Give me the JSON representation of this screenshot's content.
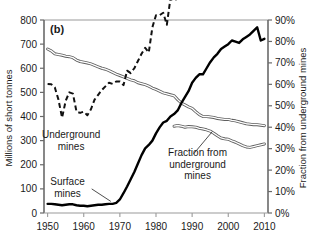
{
  "chart_data": {
    "type": "line",
    "title": "",
    "panel_label": "(b)",
    "xlabel": "",
    "ylabel": "Millions of short tonnes",
    "y2label": "Fraction from underground mines",
    "xlim": [
      1949,
      2011
    ],
    "ylim": [
      0,
      800
    ],
    "y2lim": [
      0,
      90
    ],
    "xticks": [
      1950,
      1960,
      1970,
      1980,
      1990,
      2000,
      2010
    ],
    "xticklabels": [
      "1950",
      "1960",
      "1970",
      "1980",
      "1990",
      "2000",
      "2010"
    ],
    "yticks": [
      0,
      100,
      200,
      300,
      400,
      500,
      600,
      700,
      800
    ],
    "yticklabels": [
      "0",
      "100",
      "200",
      "300",
      "400",
      "500",
      "600",
      "700",
      "800"
    ],
    "y2ticks": [
      0,
      10,
      20,
      30,
      40,
      50,
      60,
      70,
      80,
      90
    ],
    "y2ticklabels": [
      "0%",
      "10%",
      "20%",
      "30%",
      "40%",
      "50%",
      "60%",
      "70%",
      "80%",
      "90%"
    ],
    "grid": false,
    "legend_position": "inline-annotations",
    "annotations": [
      {
        "name": "underground-mines-label",
        "text_lines": [
          "Underground",
          "mines"
        ],
        "x": 1956.5,
        "y": 310,
        "leader": false
      },
      {
        "name": "surface-mines-label",
        "text_lines": [
          "Surface",
          "mines"
        ],
        "x": 1955.5,
        "y": 115,
        "leader": true
      },
      {
        "name": "fraction-underground-label",
        "text_lines": [
          "Fraction from",
          "underground",
          "mines"
        ],
        "x": 1991.5,
        "y": 235,
        "leader": true
      }
    ],
    "series": [
      {
        "name": "Underground mines",
        "axis": "left",
        "style": "double-stroke-gray",
        "color": "#6e6e6e",
        "x": [
          1950,
          1951,
          1952,
          1953,
          1954,
          1955,
          1956,
          1957,
          1958,
          1959,
          1960,
          1961,
          1962,
          1963,
          1964,
          1965,
          1966,
          1967,
          1968,
          1969,
          1970,
          1971,
          1972,
          1973,
          1974,
          1975,
          1976,
          1977,
          1978,
          1979,
          1980,
          1981,
          1982,
          1983,
          1984,
          1985,
          1986,
          1987,
          1988,
          1989,
          1990,
          1991,
          1992,
          1993,
          1994,
          1995,
          1996,
          1997,
          1998,
          1999,
          2000,
          2001,
          2002,
          2003,
          2004,
          2005,
          2006,
          2007,
          2008,
          2009,
          2010
        ],
        "values": [
          680,
          672,
          660,
          657,
          654,
          650,
          648,
          644,
          634,
          628,
          625,
          622,
          618,
          612,
          606,
          600,
          596,
          590,
          583,
          576,
          570,
          564,
          558,
          552,
          548,
          540,
          536,
          532,
          526,
          518,
          512,
          505,
          498,
          494,
          490,
          486,
          470,
          456,
          448,
          440,
          434,
          420,
          408,
          400,
          400,
          398,
          396,
          392,
          390,
          388,
          388,
          384,
          382,
          378,
          374,
          370,
          368,
          366,
          366,
          364,
          362
        ]
      },
      {
        "name": "Total production",
        "axis": "left",
        "style": "dashed-black",
        "color": "#111111",
        "x": [
          1950,
          1951,
          1952,
          1953,
          1954,
          1955,
          1956,
          1957,
          1958,
          1959,
          1960,
          1961,
          1962,
          1963,
          1964,
          1965,
          1966,
          1967,
          1968,
          1969,
          1970,
          1971,
          1972,
          1973,
          1974,
          1975,
          1976,
          1977,
          1978,
          1979,
          1980,
          1981,
          1982,
          1983,
          1984,
          1985,
          1986,
          1987,
          1988,
          1989,
          1990,
          1991,
          1992,
          1993,
          1994,
          1995,
          1996,
          1997,
          1998,
          1999,
          2000,
          2001,
          2002,
          2003,
          2004,
          2005,
          2006,
          2007,
          2008,
          2009,
          2010
        ],
        "values": [
          535,
          534,
          520,
          470,
          395,
          465,
          500,
          495,
          420,
          415,
          420,
          405,
          430,
          470,
          490,
          510,
          525,
          540,
          535,
          545,
          545,
          530,
          590,
          580,
          600,
          630,
          660,
          685,
          665,
          770,
          820,
          820,
          830,
          780,
          890,
          880,
          890,
          915,
          950,
          980,
          1030,
          995,
          1000,
          945,
          1030,
          1030,
          1060,
          1090,
          1115,
          1100,
          1075,
          1125,
          1095,
          1070,
          1110,
          1130,
          1160,
          1145,
          1170,
          1075,
          1085
        ]
      },
      {
        "name": "Surface mines",
        "axis": "left",
        "style": "solid-thick-black",
        "color": "#000000",
        "x": [
          1950,
          1951,
          1952,
          1953,
          1954,
          1955,
          1956,
          1957,
          1958,
          1959,
          1960,
          1961,
          1962,
          1963,
          1964,
          1965,
          1966,
          1967,
          1968,
          1969,
          1970,
          1971,
          1972,
          1973,
          1974,
          1975,
          1976,
          1977,
          1978,
          1979,
          1980,
          1981,
          1982,
          1983,
          1984,
          1985,
          1986,
          1987,
          1988,
          1989,
          1990,
          1991,
          1992,
          1993,
          1994,
          1995,
          1996,
          1997,
          1998,
          1999,
          2000,
          2001,
          2002,
          2003,
          2004,
          2005,
          2006,
          2007,
          2008,
          2009,
          2010
        ],
        "values": [
          38,
          38,
          36,
          34,
          32,
          34,
          36,
          36,
          32,
          30,
          30,
          28,
          30,
          32,
          34,
          34,
          36,
          38,
          38,
          42,
          56,
          82,
          110,
          140,
          170,
          205,
          240,
          268,
          282,
          300,
          330,
          355,
          375,
          382,
          400,
          410,
          425,
          455,
          480,
          505,
          540,
          560,
          575,
          575,
          600,
          625,
          645,
          660,
          680,
          690,
          700,
          715,
          710,
          705,
          720,
          730,
          740,
          755,
          770,
          715,
          722
        ]
      },
      {
        "name": "Fraction from underground mines",
        "axis": "right",
        "style": "double-stroke-gray",
        "color": "#6e6e6e",
        "x": [
          1985,
          1986,
          1987,
          1988,
          1989,
          1990,
          1991,
          1992,
          1993,
          1994,
          1995,
          1996,
          1997,
          1998,
          1999,
          2000,
          2001,
          2002,
          2003,
          2004,
          2005,
          2006,
          2007,
          2008,
          2009,
          2010
        ],
        "values": [
          40.5,
          40.8,
          40.5,
          40.0,
          40.3,
          40.2,
          40.0,
          39.5,
          39.2,
          38.8,
          38.2,
          37.2,
          36.0,
          35.0,
          34.6,
          34.4,
          33.6,
          33.0,
          32.2,
          31.4,
          30.8,
          30.6,
          31.0,
          31.4,
          31.8,
          32.2
        ]
      }
    ]
  }
}
